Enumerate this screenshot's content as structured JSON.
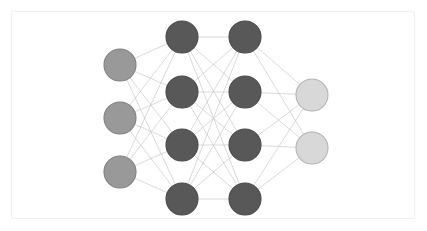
{
  "figure": {
    "background_color": "#ffffff",
    "frame_color": "#f0f0f0",
    "width": 427,
    "height": 231
  },
  "chart_data": {
    "type": "diagram",
    "diagram_kind": "neural-network-graph",
    "title": "",
    "xlabel": "",
    "ylabel": "",
    "edge_color": "#c9c9c9",
    "edge_width": 0.7,
    "fully_connected_between_adjacent_layers": true,
    "layer_count": 4,
    "node_counts": [
      3,
      4,
      4,
      2
    ],
    "layers": [
      {
        "name": "input-layer",
        "role": "input",
        "node_count": 3,
        "fill": "#999999",
        "stroke": "#818181",
        "x": 120,
        "radius": 16,
        "nodes": [
          {
            "id": "i1",
            "cx": 120,
            "cy": 65
          },
          {
            "id": "i2",
            "cx": 120,
            "cy": 118
          },
          {
            "id": "i3",
            "cx": 120,
            "cy": 172
          }
        ]
      },
      {
        "name": "hidden-layer-1",
        "role": "hidden",
        "node_count": 4,
        "fill": "#585858",
        "stroke": "#4a4a4a",
        "x": 182,
        "radius": 16,
        "nodes": [
          {
            "id": "h1-1",
            "cx": 182,
            "cy": 37
          },
          {
            "id": "h1-2",
            "cx": 182,
            "cy": 92
          },
          {
            "id": "h1-3",
            "cx": 182,
            "cy": 145
          },
          {
            "id": "h1-4",
            "cx": 182,
            "cy": 199
          }
        ]
      },
      {
        "name": "hidden-layer-2",
        "role": "hidden",
        "node_count": 4,
        "fill": "#585858",
        "stroke": "#4a4a4a",
        "x": 245,
        "radius": 16,
        "nodes": [
          {
            "id": "h2-1",
            "cx": 245,
            "cy": 37
          },
          {
            "id": "h2-2",
            "cx": 245,
            "cy": 92
          },
          {
            "id": "h2-3",
            "cx": 245,
            "cy": 145
          },
          {
            "id": "h2-4",
            "cx": 245,
            "cy": 199
          }
        ]
      },
      {
        "name": "output-layer",
        "role": "output",
        "node_count": 2,
        "fill": "#d8d8d8",
        "stroke": "#b4b4b4",
        "x": 312,
        "radius": 16,
        "nodes": [
          {
            "id": "o1",
            "cx": 312,
            "cy": 95
          },
          {
            "id": "o2",
            "cx": 312,
            "cy": 148
          }
        ]
      }
    ]
  }
}
